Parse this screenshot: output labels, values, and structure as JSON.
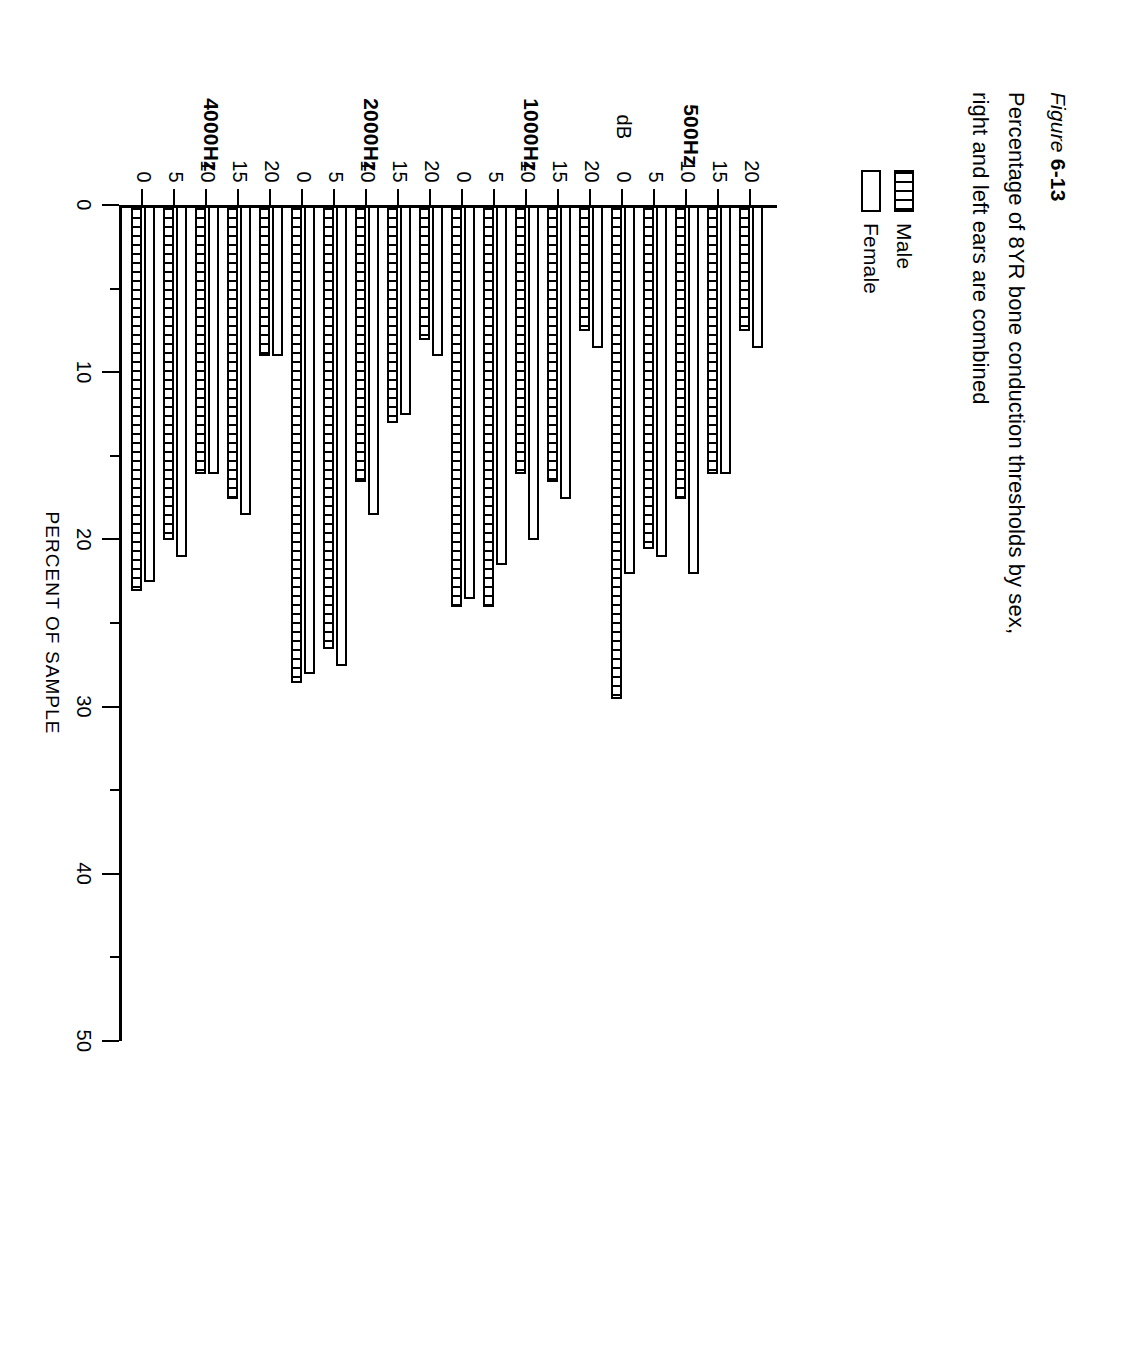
{
  "figure": {
    "number_prefix": "Figure ",
    "number": "6-13",
    "title": "Percentage of 8YR bone conduction thresholds by sex, right and left ears are combined"
  },
  "legend": {
    "position": "top-left",
    "entries": [
      {
        "label": "Male",
        "pattern": "hatched"
      },
      {
        "label": "Female",
        "pattern": "open"
      }
    ]
  },
  "axes": {
    "value_axis_title": "PERCENT OF SAMPLE",
    "value_ticks": [
      "0",
      "10",
      "20",
      "30",
      "40",
      "50"
    ],
    "category_unit_label": "dB",
    "category_ticks": [
      "0",
      "5",
      "10",
      "15",
      "20"
    ],
    "group_labels": [
      "500Hz",
      "1000Hz",
      "2000Hz",
      "4000Hz"
    ]
  },
  "chart_data": {
    "type": "bar",
    "orientation": "horizontal",
    "title": "Percentage of 8YR bone conduction thresholds by sex, right and left ears are combined",
    "xlabel": "PERCENT OF SAMPLE",
    "ylabel": "dB",
    "xlim": [
      0,
      50
    ],
    "grid": false,
    "legend_position": "top-left",
    "groups": [
      "500Hz",
      "1000Hz",
      "2000Hz",
      "4000Hz"
    ],
    "categories": [
      "0",
      "5",
      "10",
      "15",
      "20"
    ],
    "series": [
      {
        "name": "Male",
        "pattern": "hatched",
        "values": {
          "500Hz": [
            29.5,
            20.5,
            17.5,
            16.0,
            7.5
          ],
          "1000Hz": [
            24.0,
            24.0,
            16.0,
            16.5,
            7.5
          ],
          "2000Hz": [
            28.5,
            26.5,
            16.5,
            13.0,
            8.0
          ],
          "4000Hz": [
            23.0,
            20.0,
            16.0,
            17.5,
            9.0
          ]
        }
      },
      {
        "name": "Female",
        "pattern": "open",
        "values": {
          "500Hz": [
            22.0,
            21.0,
            22.0,
            16.0,
            8.5
          ],
          "1000Hz": [
            23.5,
            21.5,
            20.0,
            17.5,
            8.5
          ],
          "2000Hz": [
            28.0,
            27.5,
            18.5,
            12.5,
            9.0
          ],
          "4000Hz": [
            22.5,
            21.0,
            16.0,
            18.5,
            9.0
          ]
        }
      }
    ]
  }
}
